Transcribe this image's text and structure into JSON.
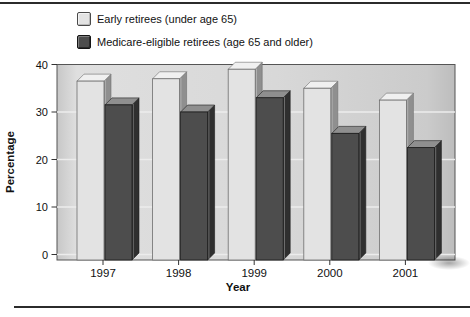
{
  "chart_data": {
    "type": "bar",
    "style": "3d-extruded-grouped",
    "categories": [
      "1997",
      "1998",
      "1999",
      "2000",
      "2001"
    ],
    "series": [
      {
        "name": "Early retirees (under age 65)",
        "values": [
          36.5,
          37,
          39,
          35,
          32.5
        ],
        "color": "#e3e3e3",
        "top_color": "#f0f0f0",
        "side_color": "#8f8f8f",
        "outline_color": "#6e6e6e"
      },
      {
        "name": "Medicare-eligible retirees (age 65 and older)",
        "values": [
          31.5,
          30,
          33,
          25.5,
          22.5
        ],
        "color": "#4d4d4d",
        "top_color": "#8f8f8f",
        "side_color": "#2f2f2f",
        "outline_color": "#1c1c1c"
      }
    ],
    "xlabel": "Year",
    "ylabel": "Percentage",
    "ylim": [
      0,
      40
    ],
    "yticks": [
      0,
      10,
      20,
      30,
      40
    ],
    "grid": true,
    "gridline_color": "#ececec",
    "plot_bg_color": "#d7d7d7",
    "plot_border_color": "#555555",
    "axis_text_color": "#111111",
    "legend_position": "top-left"
  }
}
